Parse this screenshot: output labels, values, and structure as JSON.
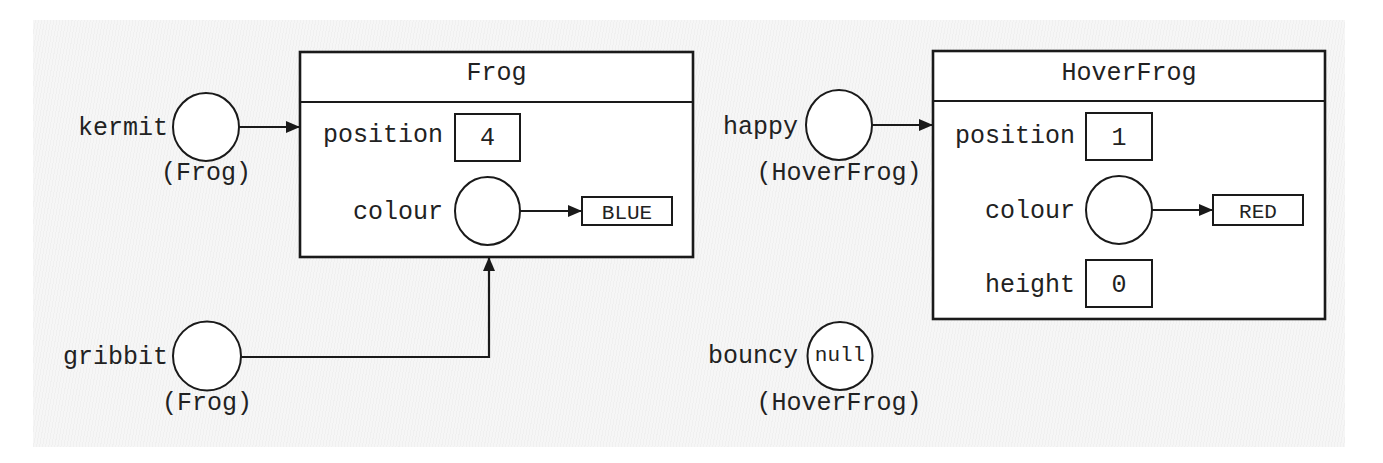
{
  "diagram": {
    "colors": {
      "stroke": "#1a1a1a",
      "text": "#222222",
      "fill": "#ffffff",
      "background": "#f6f6f6"
    },
    "variables": {
      "kermit": {
        "name": "kermit",
        "type": "(Frog)"
      },
      "gribbit": {
        "name": "gribbit",
        "type": "(Frog)"
      },
      "happy": {
        "name": "happy",
        "type": "(HoverFrog)"
      },
      "bouncy": {
        "name": "bouncy",
        "type": "(HoverFrog)",
        "value": "null"
      }
    },
    "objects": {
      "frog": {
        "class_name": "Frog",
        "fields": {
          "position": {
            "label": "position",
            "value": "4"
          },
          "colour": {
            "label": "colour",
            "value": "BLUE"
          }
        }
      },
      "hoverfrog": {
        "class_name": "HoverFrog",
        "fields": {
          "position": {
            "label": "position",
            "value": "1"
          },
          "colour": {
            "label": "colour",
            "value": "RED"
          },
          "height": {
            "label": "height",
            "value": "0"
          }
        }
      }
    }
  }
}
